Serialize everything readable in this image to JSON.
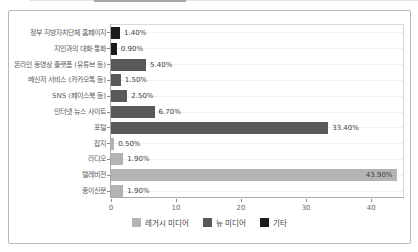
{
  "chart_data": {
    "type": "bar",
    "orientation": "horizontal",
    "title": "",
    "categories": [
      "정부 지방자치단체 홈페이지",
      "지인과의 대화·통화",
      "온라인 동영상 플랫폼 (유튜브 등)",
      "메신저 서비스 (카카오톡 등)",
      "SNS (페이스북 등)",
      "인터넷 뉴스 사이트",
      "포털",
      "잡지",
      "라디오",
      "텔레비전",
      "종이신문"
    ],
    "values": [
      1.4,
      0.9,
      5.4,
      1.5,
      2.5,
      6.7,
      33.4,
      0.5,
      1.9,
      43.9,
      1.9
    ],
    "value_labels": [
      "1.40%",
      "0.90%",
      "5.40%",
      "1.50%",
      "2.50%",
      "6.70%",
      "33.40%",
      "0.50%",
      "1.90%",
      "43.90%",
      "1.90%"
    ],
    "series_of_category": [
      "other",
      "other",
      "new",
      "new",
      "new",
      "new",
      "new",
      "legacy",
      "legacy",
      "legacy",
      "legacy"
    ],
    "series_colors": {
      "legacy": "#b3b3b3",
      "new": "#595959",
      "other": "#1c1c1c"
    },
    "legend": [
      {
        "key": "legacy",
        "label": "레거시 미디어",
        "color": "#b3b3b3"
      },
      {
        "key": "new",
        "label": "뉴 미디어",
        "color": "#595959"
      },
      {
        "key": "other",
        "label": "기타",
        "color": "#1c1c1c"
      }
    ],
    "x_ticks": [
      0,
      10,
      20,
      30,
      40
    ],
    "xlim": [
      0,
      45.2
    ],
    "ylabel": "",
    "xlabel": "",
    "grid": "horizontal"
  }
}
